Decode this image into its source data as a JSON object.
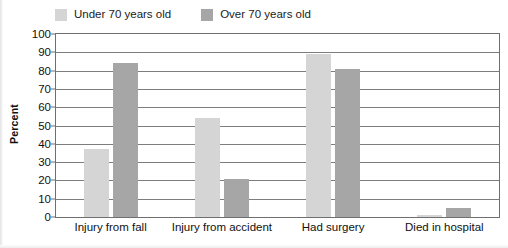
{
  "chart_data": {
    "type": "bar",
    "title": "",
    "xlabel": "",
    "ylabel": "Percent",
    "ylim": [
      0,
      100
    ],
    "ytick_step": 10,
    "yticks": [
      100,
      90,
      80,
      70,
      60,
      50,
      40,
      30,
      20,
      10,
      0
    ],
    "grid": true,
    "legend_position": "top-left",
    "categories": [
      "Injury from fall",
      "Injury from accident",
      "Had surgery",
      "Died in hospital"
    ],
    "series": [
      {
        "name": "Under 70 years old",
        "color": "#d5d5d5",
        "values": [
          37,
          54,
          89,
          1
        ]
      },
      {
        "name": "Over 70 years old",
        "color": "#a6a6a6",
        "values": [
          84,
          21,
          81,
          5
        ]
      }
    ]
  },
  "colors": {
    "series_under_70": "#d5d5d5",
    "series_over_70": "#a6a6a6",
    "gridline": "#7d7d7d",
    "frame": "#6f6f6f",
    "text": "#111111",
    "background": "#ffffff"
  }
}
